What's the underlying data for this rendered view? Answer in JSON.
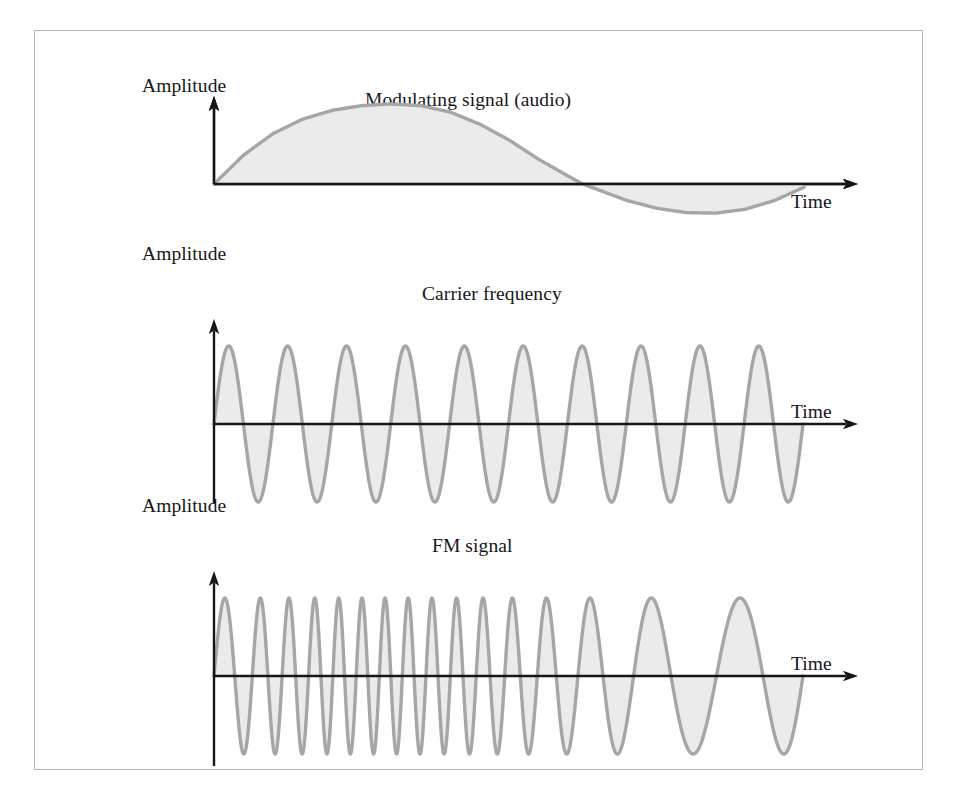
{
  "figure": {
    "frame": {
      "border_color": "#b3b3b3",
      "background": "#ffffff"
    },
    "style": {
      "wave_stroke_color": "#a6a6a6",
      "wave_fill_color": "#ebebeb",
      "axis_color": "#16161a",
      "text_color": "#16161a"
    }
  },
  "panels": [
    {
      "id": "modulating-signal",
      "y_axis_label": "Amplitude",
      "x_axis_label": "Time",
      "wave_label": "Modulating signal (audio)"
    },
    {
      "id": "carrier-frequency",
      "y_axis_label": "Amplitude",
      "x_axis_label": "Time",
      "wave_label": "Carrier frequency"
    },
    {
      "id": "fm-signal",
      "y_axis_label": "Amplitude",
      "x_axis_label": "Time",
      "wave_label": "FM signal"
    }
  ],
  "chart_data": [
    {
      "type": "line",
      "title": "Modulating signal (audio)",
      "xlabel": "Time",
      "ylabel": "Amplitude",
      "grid": false,
      "legend": "none",
      "xlim": [
        0,
        1
      ],
      "ylim": [
        -1,
        1
      ],
      "description": "One cycle of a low-frequency sine wave: rises to a positive peak, crosses zero near 65% of the span, dips to a shallower negative trough, returns toward zero at the right edge. Area between curve and the time axis is shaded light gray.",
      "series": [
        {
          "name": "Modulating signal",
          "x": [
            0.0,
            0.05,
            0.1,
            0.15,
            0.2,
            0.25,
            0.3,
            0.35,
            0.4,
            0.45,
            0.5,
            0.55,
            0.6,
            0.65,
            0.7,
            0.75,
            0.8,
            0.85,
            0.9,
            0.95,
            1.0
          ],
          "y": [
            0.0,
            0.36,
            0.63,
            0.81,
            0.92,
            0.98,
            1.0,
            0.98,
            0.9,
            0.75,
            0.55,
            0.31,
            0.1,
            -0.1,
            -0.3,
            -0.44,
            -0.52,
            -0.53,
            -0.46,
            -0.3,
            -0.06
          ]
        }
      ]
    },
    {
      "type": "line",
      "title": "Carrier frequency",
      "xlabel": "Time",
      "ylabel": "Amplitude",
      "grid": false,
      "legend": "none",
      "xlim": [
        0,
        1
      ],
      "ylim": [
        -1,
        1
      ],
      "description": "Constant-amplitude, constant-frequency sine wave. Exactly 10 complete cycles across the plotted span, starting at zero and rising.",
      "cycles": 10,
      "amplitude": 1.0,
      "frequency_constant": true
    },
    {
      "type": "line",
      "title": "FM signal",
      "xlabel": "Time",
      "ylabel": "Amplitude",
      "grid": false,
      "legend": "none",
      "xlim": [
        0,
        1
      ],
      "ylim": [
        -1,
        1
      ],
      "description": "Frequency-modulated carrier: constant amplitude while instantaneous frequency tracks the modulating signal. Cycles are compressed (high frequency) through the first half where the audio is positive, and stretched (low frequency) toward the right where the audio goes negative.",
      "cycles": 16,
      "amplitude": 1.0,
      "frequency_constant": false,
      "instantaneous_frequency_multiplier": {
        "x": [
          0.0,
          0.1,
          0.2,
          0.3,
          0.4,
          0.5,
          0.6,
          0.7,
          0.8,
          0.9,
          1.0
        ],
        "f": [
          1.0,
          1.6,
          1.95,
          2.0,
          1.85,
          1.5,
          1.05,
          0.7,
          0.5,
          0.48,
          0.62
        ]
      }
    }
  ]
}
